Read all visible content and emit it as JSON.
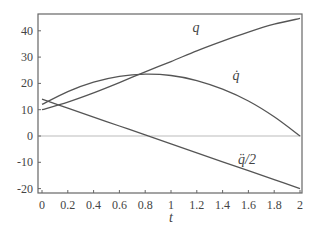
{
  "chart_data": {
    "type": "line",
    "title": "",
    "xlabel": "t",
    "ylabel": "",
    "xlim": [
      0,
      2
    ],
    "ylim": [
      -21,
      46
    ],
    "x_ticks": [
      "0",
      "0.2",
      "0.4",
      "0.6",
      "0.8",
      "1",
      "1.2",
      "1.4",
      "1.6",
      "1.8",
      "2"
    ],
    "y_ticks": [
      "-20",
      "-10",
      "0",
      "10",
      "20",
      "30",
      "40"
    ],
    "grid": false,
    "zero_line": true,
    "legend": "inline labels",
    "x": [
      0,
      0.2,
      0.4,
      0.6,
      0.8,
      1.0,
      1.2,
      1.4,
      1.6,
      1.8,
      2.0
    ],
    "series": [
      {
        "name": "q",
        "label": "q",
        "values": [
          10.0,
          12.9,
          16.4,
          20.3,
          24.4,
          28.3,
          32.4,
          36.1,
          39.5,
          42.5,
          44.7
        ]
      },
      {
        "name": "q_dot",
        "label": "q̇",
        "values": [
          12.0,
          16.9,
          20.5,
          22.7,
          23.5,
          23.0,
          21.1,
          17.8,
          13.3,
          7.3,
          0.0
        ]
      },
      {
        "name": "q_ddot_half",
        "label": "q̈/2",
        "values": [
          14.0,
          10.6,
          7.2,
          3.8,
          0.4,
          -3.0,
          -6.4,
          -9.8,
          -13.2,
          -16.6,
          -20.0
        ]
      }
    ]
  }
}
